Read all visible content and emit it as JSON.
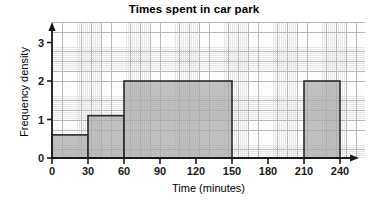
{
  "chart_data": {
    "type": "bar",
    "title": "Times spent in car park",
    "xlabel": "Time (minutes)",
    "ylabel": "Frequency density",
    "xlim": [
      0,
      240
    ],
    "ylim": [
      0,
      3.4
    ],
    "grid": true,
    "legend": null,
    "xticks": [
      "0",
      "30",
      "60",
      "90",
      "120",
      "150",
      "180",
      "210",
      "240"
    ],
    "xtick_values": [
      0,
      30,
      60,
      90,
      120,
      150,
      180,
      210,
      240
    ],
    "yticks": [
      "0",
      "1",
      "2",
      "3"
    ],
    "ytick_values": [
      0,
      1,
      2,
      3
    ],
    "bars": [
      {
        "label": "0-30",
        "x_start": 0,
        "x_end": 30,
        "value": 0.6
      },
      {
        "label": "30-60",
        "x_start": 30,
        "x_end": 60,
        "value": 1.1
      },
      {
        "label": "60-150",
        "x_start": 60,
        "x_end": 150,
        "value": 2.0
      },
      {
        "label": "210-240",
        "x_start": 210,
        "x_end": 240,
        "value": 2.0
      }
    ],
    "categories": [
      "0-30",
      "30-60",
      "60-150",
      "210-240"
    ],
    "values": [
      0.6,
      1.1,
      2.0,
      2.0
    ],
    "colors": {
      "bar_fill": "#a8a8a8",
      "bar_edge": "#2b2b2b",
      "axis": "#1a1a1a",
      "grid_minor": "#e6e6e6",
      "grid_major": "#b9b9b9",
      "background": "#fdfdfd"
    }
  }
}
